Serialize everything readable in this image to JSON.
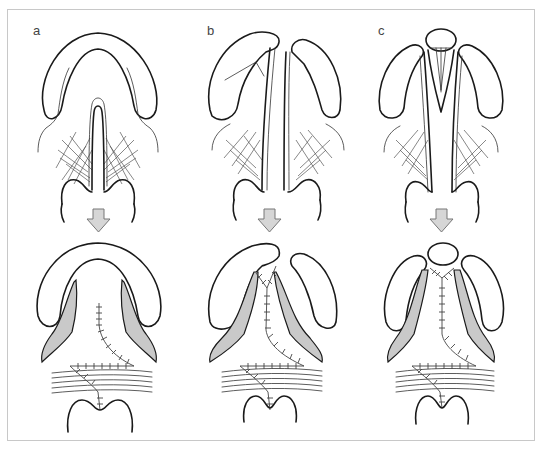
{
  "figure": {
    "type": "surgical-technique-illustration",
    "layout": "3 columns x 2 rows (before / after)",
    "colors": {
      "frame_border": "#c8c8c8",
      "outline": "#1a1a1a",
      "shaded_tissue": "#c9c9c9",
      "arrow_fill": "#d6d6d6",
      "arrow_stroke": "#777777"
    }
  },
  "panels": [
    {
      "label": "a",
      "top": "intact alveolar arch with midline cleft of soft palate",
      "arrow": "down-arrow",
      "bottom": "closed repair with Z-shaped suture line"
    },
    {
      "label": "b",
      "top": "complete cleft with separated alveolar segments",
      "arrow": "down-arrow",
      "bottom": "closed repair with Y-shaped suture line"
    },
    {
      "label": "c",
      "top": "bilateral cleft with central premaxilla and vomer",
      "arrow": "down-arrow",
      "bottom": "closed repair with Y-shaped suture line, premaxilla separate"
    }
  ]
}
